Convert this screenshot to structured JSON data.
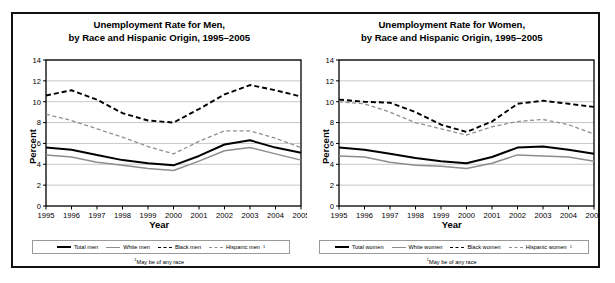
{
  "figure": {
    "name": "unemployment-rate-by-sex-race-hispanic-origin"
  },
  "panels": [
    {
      "id": "men",
      "title_line1": "Unemployment Rate for Men,",
      "title_line2": "by Race and Hispanic Origin, 1995–2005",
      "xlabel": "Year",
      "ylabel": "Percent",
      "footnote": "May be of any race",
      "footnote_marker": "1",
      "legend": [
        {
          "label": "Total men",
          "style": "solid-black"
        },
        {
          "label": "White men",
          "style": "solid-gray"
        },
        {
          "label": "Black men",
          "style": "dashed-black"
        },
        {
          "label": "Hispanic men",
          "style": "dashed-gray",
          "marker": "1"
        }
      ]
    },
    {
      "id": "women",
      "title_line1": "Unemployment Rate for Women,",
      "title_line2": "by Race and Hispanic Origin, 1995–2005",
      "xlabel": "Year",
      "ylabel": "Percent",
      "footnote": "May be of any race",
      "footnote_marker": "1",
      "legend": [
        {
          "label": "Total women",
          "style": "solid-black"
        },
        {
          "label": "White women",
          "style": "solid-gray"
        },
        {
          "label": "Black women",
          "style": "dashed-black"
        },
        {
          "label": "Hispanic women",
          "style": "dashed-gray",
          "marker": "1"
        }
      ]
    }
  ],
  "chart_data": [
    {
      "type": "line",
      "title": "Unemployment Rate for Men, by Race and Hispanic Origin, 1995–2005",
      "xlabel": "Year",
      "ylabel": "Percent",
      "x": [
        1995,
        1996,
        1997,
        1998,
        1999,
        2000,
        2001,
        2002,
        2003,
        2004,
        2005
      ],
      "xticklabels": [
        "1995",
        "1996",
        "1997",
        "1998",
        "1999",
        "2000",
        "2001",
        "2002",
        "2003",
        "2004",
        "2005"
      ],
      "ylim": [
        0,
        14
      ],
      "yticks": [
        0,
        2,
        4,
        6,
        8,
        10,
        12,
        14
      ],
      "grid": "horizontal",
      "legend_position": "below",
      "series": [
        {
          "name": "Total men",
          "color": "#000000",
          "dash": "solid",
          "values": [
            5.6,
            5.4,
            4.9,
            4.4,
            4.1,
            3.9,
            4.8,
            5.9,
            6.3,
            5.6,
            5.1
          ]
        },
        {
          "name": "White men",
          "color": "#8d8d8d",
          "dash": "solid",
          "values": [
            4.9,
            4.7,
            4.2,
            3.9,
            3.6,
            3.4,
            4.3,
            5.3,
            5.6,
            5.0,
            4.4
          ]
        },
        {
          "name": "Black men",
          "color": "#000000",
          "dash": "dashed",
          "values": [
            10.6,
            11.1,
            10.2,
            8.9,
            8.2,
            8.0,
            9.3,
            10.7,
            11.6,
            11.1,
            10.5
          ]
        },
        {
          "name": "Hispanic men",
          "color": "#909090",
          "dash": "dashed",
          "values": [
            8.8,
            8.2,
            7.4,
            6.6,
            5.7,
            5.0,
            6.2,
            7.2,
            7.2,
            6.5,
            5.6
          ]
        }
      ]
    },
    {
      "type": "line",
      "title": "Unemployment Rate for Women, by Race and Hispanic Origin, 1995–2005",
      "xlabel": "Year",
      "ylabel": "Percent",
      "x": [
        1995,
        1996,
        1997,
        1998,
        1999,
        2000,
        2001,
        2002,
        2003,
        2004,
        2005
      ],
      "xticklabels": [
        "1995",
        "1996",
        "1997",
        "1998",
        "1999",
        "2000",
        "2001",
        "2002",
        "2003",
        "2004",
        "2005"
      ],
      "ylim": [
        0,
        14
      ],
      "yticks": [
        0,
        2,
        4,
        6,
        8,
        10,
        12,
        14
      ],
      "grid": "horizontal",
      "legend_position": "below",
      "series": [
        {
          "name": "Total women",
          "color": "#000000",
          "dash": "solid",
          "values": [
            5.6,
            5.4,
            5.0,
            4.6,
            4.3,
            4.1,
            4.7,
            5.6,
            5.7,
            5.4,
            5.0
          ]
        },
        {
          "name": "White women",
          "color": "#8d8d8d",
          "dash": "solid",
          "values": [
            4.8,
            4.7,
            4.2,
            3.9,
            3.8,
            3.6,
            4.1,
            4.9,
            4.8,
            4.7,
            4.3
          ]
        },
        {
          "name": "Black women",
          "color": "#000000",
          "dash": "dashed",
          "values": [
            10.2,
            10.0,
            9.9,
            9.0,
            7.8,
            7.1,
            8.1,
            9.8,
            10.1,
            9.8,
            9.5
          ]
        },
        {
          "name": "Hispanic women",
          "color": "#909090",
          "dash": "dashed",
          "values": [
            10.0,
            9.8,
            9.0,
            8.0,
            7.4,
            6.8,
            7.6,
            8.1,
            8.3,
            7.8,
            6.9
          ]
        }
      ]
    }
  ]
}
